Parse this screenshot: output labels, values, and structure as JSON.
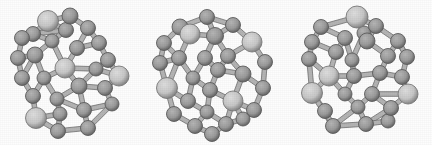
{
  "figure": {
    "background_color": "#fdfdfd",
    "width": 432,
    "height": 145,
    "style": "ball-and-stick molecular cage (fullerene-like) grayscale rendering"
  },
  "palette": {
    "atom_dark_fill": "#9a9a9a",
    "atom_dark_stroke": "#5d5d5d",
    "atom_light_fill": "#c6c6c6",
    "atom_light_stroke": "#7b7b7b",
    "bond_fill": "#b4b4b4",
    "bond_stroke": "#6e6e6e",
    "background": "#fdfdfd"
  },
  "panels": [
    {
      "name": "cluster-structure-1",
      "label": "",
      "offset_x": 0,
      "atoms": [
        {
          "id": 0,
          "x": 48,
          "y": 21,
          "r": 10.5,
          "shade": "light"
        },
        {
          "id": 1,
          "x": 70,
          "y": 16,
          "r": 8.0,
          "shade": "dark"
        },
        {
          "id": 2,
          "x": 66,
          "y": 30,
          "r": 7.5,
          "shade": "dark"
        },
        {
          "id": 3,
          "x": 88,
          "y": 28,
          "r": 7.5,
          "shade": "dark"
        },
        {
          "id": 4,
          "x": 99,
          "y": 43,
          "r": 7.5,
          "shade": "dark"
        },
        {
          "id": 5,
          "x": 33,
          "y": 34,
          "r": 7.5,
          "shade": "dark"
        },
        {
          "id": 6,
          "x": 22,
          "y": 38,
          "r": 7.5,
          "shade": "dark"
        },
        {
          "id": 7,
          "x": 52,
          "y": 41,
          "r": 7.0,
          "shade": "dark"
        },
        {
          "id": 8,
          "x": 77,
          "y": 48,
          "r": 7.5,
          "shade": "dark"
        },
        {
          "id": 9,
          "x": 108,
          "y": 60,
          "r": 7.5,
          "shade": "dark"
        },
        {
          "id": 10,
          "x": 18,
          "y": 58,
          "r": 7.5,
          "shade": "dark"
        },
        {
          "id": 11,
          "x": 35,
          "y": 55,
          "r": 8.0,
          "shade": "dark"
        },
        {
          "id": 12,
          "x": 65,
          "y": 68,
          "r": 10.0,
          "shade": "light"
        },
        {
          "id": 13,
          "x": 96,
          "y": 69,
          "r": 7.0,
          "shade": "dark"
        },
        {
          "id": 14,
          "x": 119,
          "y": 76,
          "r": 10.0,
          "shade": "light"
        },
        {
          "id": 15,
          "x": 22,
          "y": 78,
          "r": 7.5,
          "shade": "dark"
        },
        {
          "id": 16,
          "x": 44,
          "y": 78,
          "r": 7.0,
          "shade": "dark"
        },
        {
          "id": 17,
          "x": 79,
          "y": 86,
          "r": 8.0,
          "shade": "dark"
        },
        {
          "id": 18,
          "x": 105,
          "y": 88,
          "r": 7.5,
          "shade": "dark"
        },
        {
          "id": 19,
          "x": 33,
          "y": 96,
          "r": 7.5,
          "shade": "dark"
        },
        {
          "id": 20,
          "x": 57,
          "y": 99,
          "r": 7.0,
          "shade": "dark"
        },
        {
          "id": 21,
          "x": 112,
          "y": 104,
          "r": 7.0,
          "shade": "dark"
        },
        {
          "id": 22,
          "x": 36,
          "y": 118,
          "r": 10.5,
          "shade": "light"
        },
        {
          "id": 23,
          "x": 60,
          "y": 114,
          "r": 7.0,
          "shade": "dark"
        },
        {
          "id": 24,
          "x": 84,
          "y": 110,
          "r": 7.5,
          "shade": "dark"
        },
        {
          "id": 25,
          "x": 58,
          "y": 131,
          "r": 7.5,
          "shade": "dark"
        },
        {
          "id": 26,
          "x": 88,
          "y": 128,
          "r": 7.5,
          "shade": "dark"
        }
      ],
      "bonds": [
        [
          0,
          1
        ],
        [
          0,
          2
        ],
        [
          0,
          5
        ],
        [
          1,
          2
        ],
        [
          1,
          3
        ],
        [
          3,
          4
        ],
        [
          2,
          7
        ],
        [
          5,
          6
        ],
        [
          5,
          7
        ],
        [
          6,
          10
        ],
        [
          4,
          8
        ],
        [
          4,
          9
        ],
        [
          3,
          8
        ],
        [
          8,
          12
        ],
        [
          7,
          12
        ],
        [
          7,
          11
        ],
        [
          10,
          11
        ],
        [
          11,
          15
        ],
        [
          10,
          15
        ],
        [
          12,
          13
        ],
        [
          9,
          13
        ],
        [
          9,
          14
        ],
        [
          13,
          14
        ],
        [
          13,
          17
        ],
        [
          12,
          17
        ],
        [
          11,
          16
        ],
        [
          16,
          19
        ],
        [
          15,
          19
        ],
        [
          16,
          20
        ],
        [
          17,
          20
        ],
        [
          17,
          18
        ],
        [
          14,
          18
        ],
        [
          18,
          21
        ],
        [
          21,
          26
        ],
        [
          19,
          22
        ],
        [
          20,
          23
        ],
        [
          22,
          23
        ],
        [
          23,
          25
        ],
        [
          25,
          26
        ],
        [
          24,
          26
        ],
        [
          17,
          24
        ],
        [
          22,
          25
        ],
        [
          24,
          21
        ],
        [
          2,
          5
        ],
        [
          12,
          16
        ],
        [
          20,
          24
        ]
      ]
    },
    {
      "name": "cluster-structure-2",
      "label": "",
      "offset_x": 144,
      "atoms": [
        {
          "id": 0,
          "x": 63,
          "y": 17,
          "r": 7.5,
          "shade": "dark"
        },
        {
          "id": 1,
          "x": 36,
          "y": 27,
          "r": 8.0,
          "shade": "dark"
        },
        {
          "id": 2,
          "x": 89,
          "y": 25,
          "r": 7.5,
          "shade": "dark"
        },
        {
          "id": 3,
          "x": 46,
          "y": 34,
          "r": 10.0,
          "shade": "light"
        },
        {
          "id": 4,
          "x": 71,
          "y": 36,
          "r": 8.5,
          "shade": "dark"
        },
        {
          "id": 5,
          "x": 20,
          "y": 43,
          "r": 7.5,
          "shade": "dark"
        },
        {
          "id": 6,
          "x": 108,
          "y": 42,
          "r": 10.0,
          "shade": "light"
        },
        {
          "id": 7,
          "x": 16,
          "y": 63,
          "r": 7.5,
          "shade": "dark"
        },
        {
          "id": 8,
          "x": 35,
          "y": 58,
          "r": 7.5,
          "shade": "dark"
        },
        {
          "id": 9,
          "x": 61,
          "y": 58,
          "r": 7.5,
          "shade": "dark"
        },
        {
          "id": 10,
          "x": 84,
          "y": 56,
          "r": 7.5,
          "shade": "dark"
        },
        {
          "id": 11,
          "x": 121,
          "y": 62,
          "r": 7.5,
          "shade": "dark"
        },
        {
          "id": 12,
          "x": 74,
          "y": 70,
          "r": 7.5,
          "shade": "dark"
        },
        {
          "id": 13,
          "x": 49,
          "y": 78,
          "r": 7.0,
          "shade": "dark"
        },
        {
          "id": 14,
          "x": 99,
          "y": 74,
          "r": 8.0,
          "shade": "dark"
        },
        {
          "id": 15,
          "x": 23,
          "y": 88,
          "r": 10.5,
          "shade": "light"
        },
        {
          "id": 16,
          "x": 66,
          "y": 90,
          "r": 7.5,
          "shade": "dark"
        },
        {
          "id": 17,
          "x": 119,
          "y": 88,
          "r": 7.5,
          "shade": "dark"
        },
        {
          "id": 18,
          "x": 44,
          "y": 101,
          "r": 7.5,
          "shade": "dark"
        },
        {
          "id": 19,
          "x": 89,
          "y": 101,
          "r": 10.0,
          "shade": "light"
        },
        {
          "id": 20,
          "x": 30,
          "y": 114,
          "r": 7.5,
          "shade": "dark"
        },
        {
          "id": 21,
          "x": 63,
          "y": 112,
          "r": 7.0,
          "shade": "dark"
        },
        {
          "id": 22,
          "x": 110,
          "y": 110,
          "r": 7.5,
          "shade": "dark"
        },
        {
          "id": 23,
          "x": 51,
          "y": 126,
          "r": 7.5,
          "shade": "dark"
        },
        {
          "id": 24,
          "x": 82,
          "y": 124,
          "r": 7.5,
          "shade": "dark"
        },
        {
          "id": 25,
          "x": 99,
          "y": 119,
          "r": 7.0,
          "shade": "dark"
        },
        {
          "id": 26,
          "x": 68,
          "y": 134,
          "r": 7.5,
          "shade": "dark"
        }
      ],
      "bonds": [
        [
          0,
          1
        ],
        [
          0,
          2
        ],
        [
          0,
          4
        ],
        [
          1,
          3
        ],
        [
          1,
          5
        ],
        [
          3,
          4
        ],
        [
          2,
          4
        ],
        [
          2,
          6
        ],
        [
          5,
          7
        ],
        [
          5,
          8
        ],
        [
          3,
          8
        ],
        [
          4,
          9
        ],
        [
          4,
          10
        ],
        [
          6,
          10
        ],
        [
          6,
          11
        ],
        [
          10,
          14
        ],
        [
          9,
          12
        ],
        [
          10,
          12
        ],
        [
          9,
          13
        ],
        [
          8,
          13
        ],
        [
          7,
          15
        ],
        [
          8,
          15
        ],
        [
          11,
          17
        ],
        [
          14,
          17
        ],
        [
          12,
          14
        ],
        [
          12,
          16
        ],
        [
          13,
          16
        ],
        [
          13,
          18
        ],
        [
          15,
          18
        ],
        [
          15,
          20
        ],
        [
          16,
          21
        ],
        [
          18,
          21
        ],
        [
          16,
          19
        ],
        [
          14,
          19
        ],
        [
          19,
          22
        ],
        [
          17,
          22
        ],
        [
          20,
          23
        ],
        [
          21,
          23
        ],
        [
          19,
          25
        ],
        [
          22,
          25
        ],
        [
          23,
          26
        ],
        [
          24,
          26
        ],
        [
          21,
          24
        ],
        [
          24,
          25
        ],
        [
          7,
          8
        ],
        [
          19,
          24
        ]
      ]
    },
    {
      "name": "cluster-structure-3",
      "label": "",
      "offset_x": 288,
      "atoms": [
        {
          "id": 0,
          "x": 69,
          "y": 17,
          "r": 11.0,
          "shade": "light"
        },
        {
          "id": 1,
          "x": 33,
          "y": 27,
          "r": 7.5,
          "shade": "dark"
        },
        {
          "id": 2,
          "x": 88,
          "y": 26,
          "r": 7.5,
          "shade": "dark"
        },
        {
          "id": 3,
          "x": 76,
          "y": 33,
          "r": 7.0,
          "shade": "dark"
        },
        {
          "id": 4,
          "x": 24,
          "y": 42,
          "r": 7.5,
          "shade": "dark"
        },
        {
          "id": 5,
          "x": 57,
          "y": 38,
          "r": 7.5,
          "shade": "dark"
        },
        {
          "id": 6,
          "x": 79,
          "y": 41,
          "r": 8.0,
          "shade": "dark"
        },
        {
          "id": 7,
          "x": 110,
          "y": 41,
          "r": 7.5,
          "shade": "dark"
        },
        {
          "id": 8,
          "x": 21,
          "y": 59,
          "r": 7.5,
          "shade": "dark"
        },
        {
          "id": 9,
          "x": 48,
          "y": 52,
          "r": 7.5,
          "shade": "dark"
        },
        {
          "id": 10,
          "x": 100,
          "y": 56,
          "r": 7.5,
          "shade": "dark"
        },
        {
          "id": 11,
          "x": 119,
          "y": 57,
          "r": 7.5,
          "shade": "dark"
        },
        {
          "id": 12,
          "x": 64,
          "y": 60,
          "r": 7.0,
          "shade": "dark"
        },
        {
          "id": 13,
          "x": 41,
          "y": 76,
          "r": 10.0,
          "shade": "light"
        },
        {
          "id": 14,
          "x": 66,
          "y": 76,
          "r": 7.5,
          "shade": "dark"
        },
        {
          "id": 15,
          "x": 92,
          "y": 73,
          "r": 7.5,
          "shade": "dark"
        },
        {
          "id": 16,
          "x": 114,
          "y": 77,
          "r": 7.5,
          "shade": "dark"
        },
        {
          "id": 17,
          "x": 24,
          "y": 93,
          "r": 10.5,
          "shade": "light"
        },
        {
          "id": 18,
          "x": 57,
          "y": 94,
          "r": 7.0,
          "shade": "dark"
        },
        {
          "id": 19,
          "x": 84,
          "y": 94,
          "r": 7.5,
          "shade": "dark"
        },
        {
          "id": 20,
          "x": 120,
          "y": 94,
          "r": 10.0,
          "shade": "light"
        },
        {
          "id": 21,
          "x": 37,
          "y": 111,
          "r": 7.5,
          "shade": "dark"
        },
        {
          "id": 22,
          "x": 70,
          "y": 107,
          "r": 7.0,
          "shade": "dark"
        },
        {
          "id": 23,
          "x": 103,
          "y": 108,
          "r": 7.5,
          "shade": "dark"
        },
        {
          "id": 24,
          "x": 45,
          "y": 126,
          "r": 7.5,
          "shade": "dark"
        },
        {
          "id": 25,
          "x": 78,
          "y": 124,
          "r": 7.5,
          "shade": "dark"
        },
        {
          "id": 26,
          "x": 100,
          "y": 121,
          "r": 7.0,
          "shade": "dark"
        }
      ],
      "bonds": [
        [
          0,
          1
        ],
        [
          0,
          2
        ],
        [
          0,
          3
        ],
        [
          1,
          4
        ],
        [
          1,
          5
        ],
        [
          3,
          6
        ],
        [
          2,
          6
        ],
        [
          2,
          7
        ],
        [
          5,
          9
        ],
        [
          5,
          12
        ],
        [
          3,
          12
        ],
        [
          6,
          10
        ],
        [
          7,
          10
        ],
        [
          7,
          11
        ],
        [
          4,
          8
        ],
        [
          4,
          9
        ],
        [
          9,
          13
        ],
        [
          8,
          13
        ],
        [
          8,
          17
        ],
        [
          12,
          14
        ],
        [
          10,
          15
        ],
        [
          11,
          16
        ],
        [
          15,
          16
        ],
        [
          14,
          15
        ],
        [
          13,
          14
        ],
        [
          14,
          18
        ],
        [
          13,
          18
        ],
        [
          15,
          19
        ],
        [
          16,
          20
        ],
        [
          19,
          20
        ],
        [
          17,
          21
        ],
        [
          13,
          17
        ],
        [
          18,
          22
        ],
        [
          19,
          22
        ],
        [
          19,
          23
        ],
        [
          20,
          23
        ],
        [
          21,
          24
        ],
        [
          22,
          24
        ],
        [
          22,
          25
        ],
        [
          23,
          26
        ],
        [
          25,
          26
        ],
        [
          24,
          25
        ],
        [
          17,
          24
        ],
        [
          11,
          7
        ],
        [
          23,
          25
        ]
      ]
    }
  ]
}
